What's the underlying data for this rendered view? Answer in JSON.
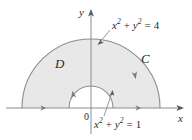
{
  "figure": {
    "name": "semicircular-annulus-region-diagram",
    "background_color": "#ffffff",
    "shading_color": "#e8e8e8",
    "stroke_color": "#8c8c8c",
    "text_color": "#2b2b2b",
    "axes": {
      "x_label": "x",
      "y_label": "y",
      "origin_label": "0",
      "x_axis_y_px": 108,
      "origin_x_px": 91
    },
    "labels": {
      "outer_circle": {
        "text": "x2 + y2 = 4",
        "var1": "x",
        "exp1": "2",
        "plus": " + ",
        "var2": "y",
        "exp2": "2",
        "equals": " = ",
        "value": "4"
      },
      "inner_circle": {
        "text": "x2 + y2 = 1",
        "var1": "x",
        "exp1": "2",
        "plus": " + ",
        "var2": "y",
        "exp2": "2",
        "equals": " = ",
        "value": "1"
      },
      "region": "D",
      "curve": "C"
    },
    "geometry": {
      "outer_radius_px": 69,
      "inner_radius_px": 22,
      "outer_radius_value": 2,
      "inner_radius_value": 1,
      "shape": "upper half annulus between circle of radius 1 and circle of radius 2"
    },
    "orientation_arrows": [
      {
        "name": "outer-arc-arrow-right",
        "position": "outer arc right side"
      },
      {
        "name": "inner-arc-arrow-left",
        "position": "inner arc left side"
      },
      {
        "name": "x-axis-arrow-left-segment",
        "position": "left bottom segment pointing right"
      },
      {
        "name": "x-axis-arrow-right-segment",
        "position": "right bottom segment pointing right"
      }
    ]
  }
}
